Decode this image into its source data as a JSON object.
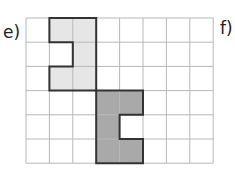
{
  "labels": {
    "left": "e)",
    "right": "f)"
  },
  "grid": {
    "cols": 8,
    "rows": 6,
    "x0": 26,
    "y0": 18,
    "cw": 23.4,
    "ch": 24.2,
    "line_color": "#b8b8b8"
  },
  "shapes": [
    {
      "name": "light-shape",
      "fill": "#e6e6e6",
      "cells": [
        [
          1,
          0
        ],
        [
          2,
          0
        ],
        [
          2,
          1
        ],
        [
          1,
          2
        ],
        [
          2,
          2
        ]
      ],
      "outline": [
        [
          1,
          0
        ],
        [
          3,
          0
        ],
        [
          3,
          3
        ],
        [
          1,
          3
        ],
        [
          1,
          2
        ],
        [
          2,
          2
        ],
        [
          2,
          1
        ],
        [
          1,
          1
        ]
      ]
    },
    {
      "name": "dark-shape",
      "fill": "#a9a9a9",
      "cells": [
        [
          3,
          3
        ],
        [
          4,
          3
        ],
        [
          3,
          4
        ],
        [
          3,
          5
        ],
        [
          4,
          5
        ]
      ],
      "outline": [
        [
          3,
          3
        ],
        [
          5,
          3
        ],
        [
          5,
          4
        ],
        [
          4,
          4
        ],
        [
          4,
          5
        ],
        [
          5,
          5
        ],
        [
          5,
          6
        ],
        [
          3,
          6
        ]
      ]
    }
  ],
  "outline_color": "#333333"
}
